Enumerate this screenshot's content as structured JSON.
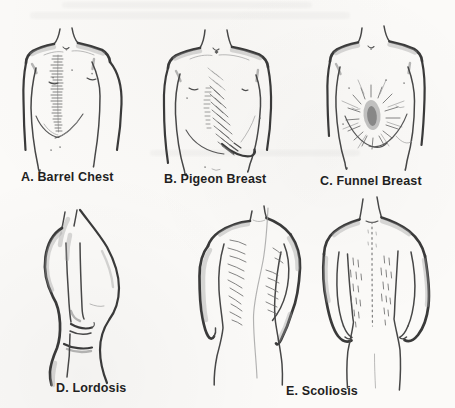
{
  "page": {
    "background_color": "#fbfaf8",
    "ink_color": "#1f1f1f",
    "sketch_stroke_color": "#3a3a3a",
    "shading_color": "#9b9b9b"
  },
  "figures": [
    {
      "id": "A",
      "label": "A. Barrel Chest"
    },
    {
      "id": "B",
      "label": "B. Pigeon Breast"
    },
    {
      "id": "C",
      "label": "C. Funnel Breast"
    },
    {
      "id": "D",
      "label": "D. Lordosis"
    },
    {
      "id": "E",
      "label": "E. Scoliosis"
    }
  ]
}
